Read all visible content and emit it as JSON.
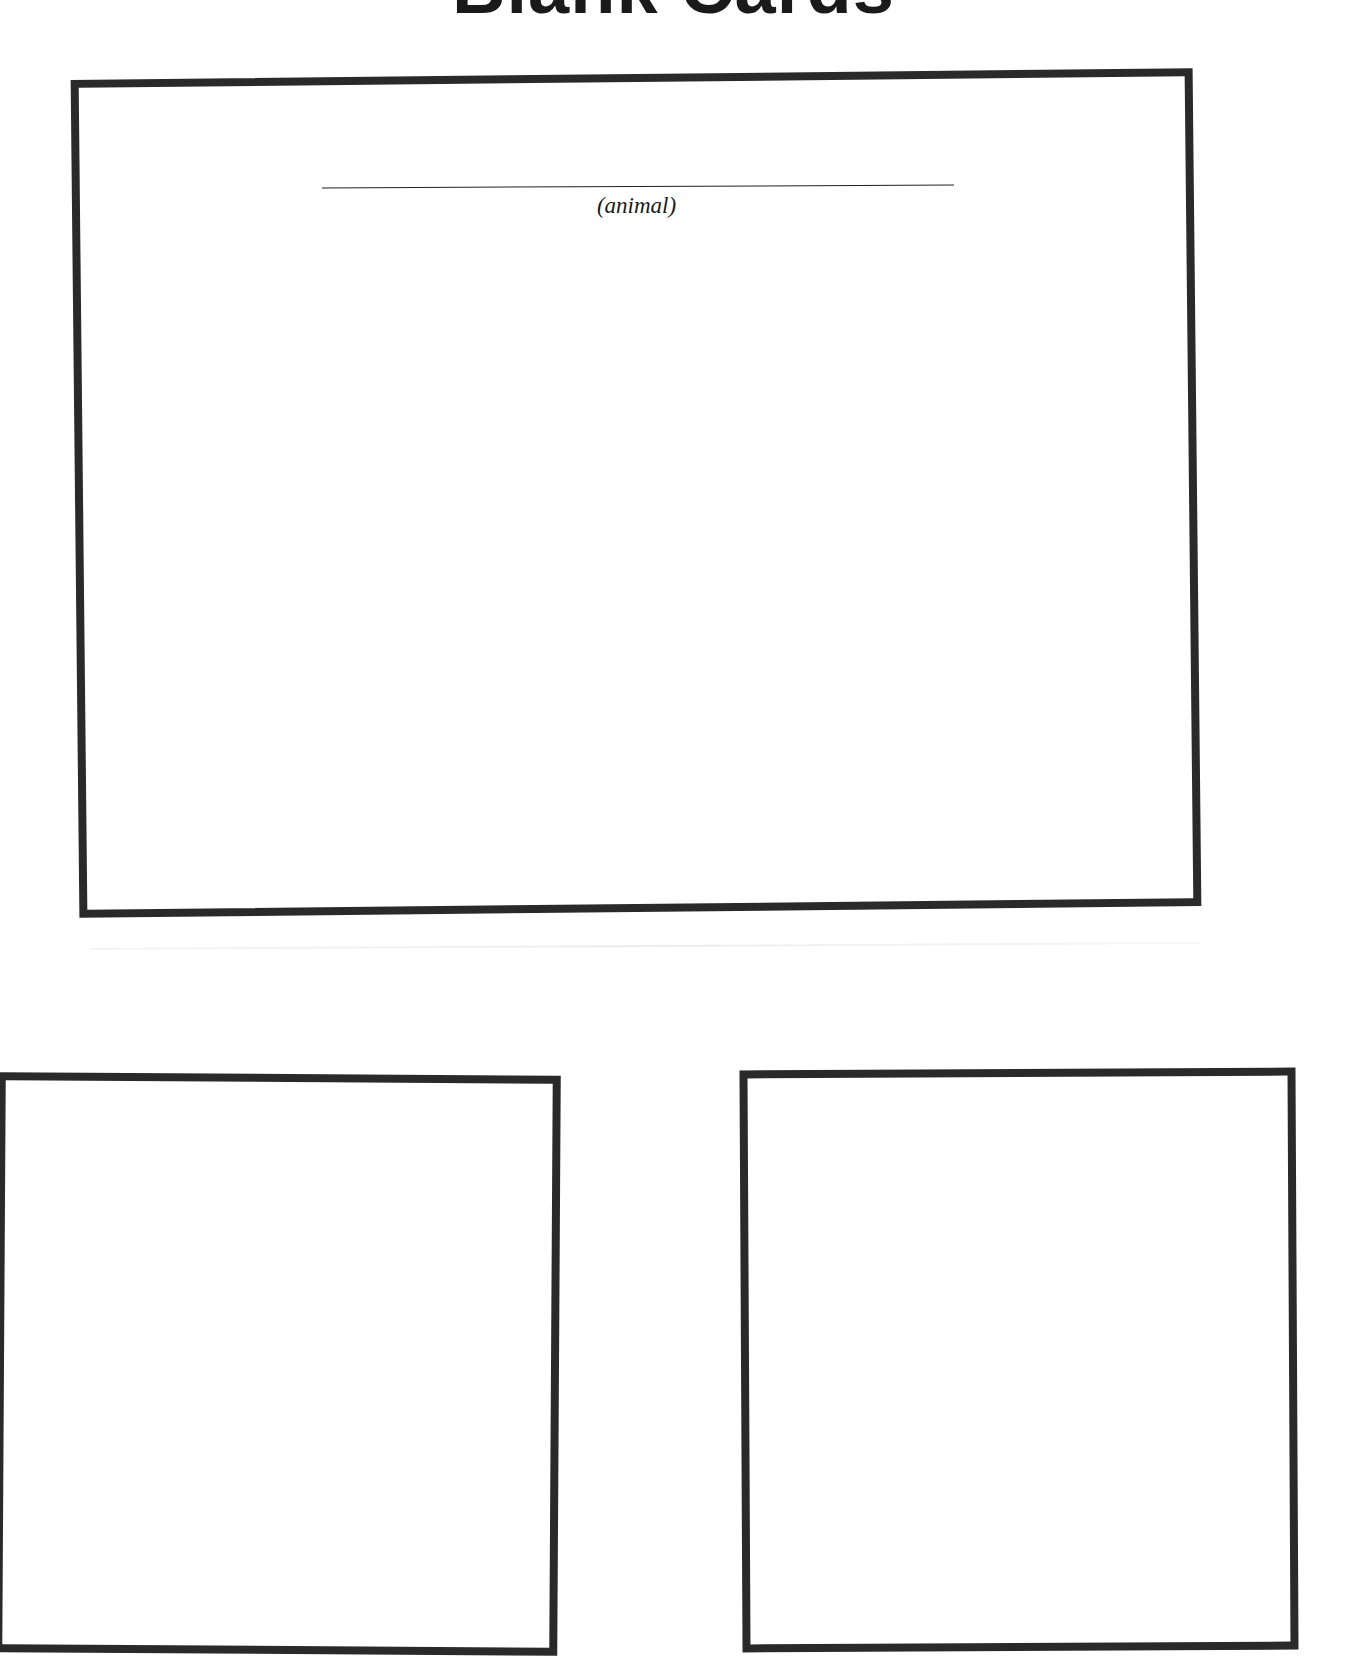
{
  "page": {
    "title": "Blank Cards",
    "background_color": "#ffffff",
    "border_color": "#2a2a2a"
  },
  "cards": [
    {
      "id": "main",
      "fill_in_line": {
        "caption": "(animal)"
      }
    },
    {
      "id": "bottom-left"
    },
    {
      "id": "bottom-right"
    }
  ]
}
